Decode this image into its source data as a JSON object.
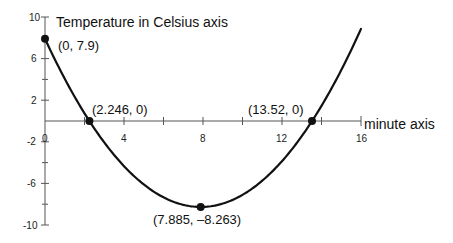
{
  "chart_data": {
    "type": "line",
    "title": "",
    "xlabel": "minute axis",
    "ylabel": "Temperature in Celsius axis",
    "xlim": [
      0,
      16
    ],
    "ylim": [
      -10,
      10
    ],
    "x_ticks": [
      0,
      4,
      8,
      12,
      16
    ],
    "y_ticks": [
      10,
      6,
      2,
      -2,
      -6,
      -10
    ],
    "x_tick_labels": [
      "0",
      "4",
      "8",
      "12",
      "16"
    ],
    "y_tick_labels": [
      "10",
      "6",
      "2",
      "-2",
      "-6",
      "-10"
    ],
    "grid": false,
    "legend": null,
    "series": [
      {
        "name": "temperature curve (parabola)",
        "x": [
          0,
          1,
          2,
          2.246,
          3,
          4,
          5,
          6,
          7,
          7.885,
          9,
          10,
          11,
          12,
          13,
          13.52,
          14,
          15,
          16
        ],
        "y": [
          7.9,
          4.33,
          1.3,
          0,
          -2.1,
          -4.47,
          -6.1,
          -7.34,
          -8.06,
          -8.263,
          -7.94,
          -7.1,
          -5.72,
          -3.85,
          -1.42,
          0,
          1.27,
          4.65,
          8.85
        ]
      }
    ],
    "annotations": [
      {
        "x": 0,
        "y": 7.9,
        "label": "(0, 7.9)"
      },
      {
        "x": 2.246,
        "y": 0,
        "label": "(2.246, 0)"
      },
      {
        "x": 13.52,
        "y": 0,
        "label": "(13.52, 0)"
      },
      {
        "x": 7.885,
        "y": -8.263,
        "label": "(7.885, –8.263)"
      }
    ]
  },
  "labels": {
    "y_axis_title": "Temperature in Celsius axis",
    "x_axis_title": "minute axis",
    "tick_x0": "0",
    "tick_x4": "4",
    "tick_x8": "8",
    "tick_x12": "12",
    "tick_x16": "16",
    "tick_y10": "10",
    "tick_y6": "6",
    "tick_y2": "2",
    "tick_yn2": "-2",
    "tick_yn6": "-6",
    "tick_yn10": "-10",
    "pt_start": "(0, 7.9)",
    "pt_root1": "(2.246, 0)",
    "pt_root2": "(13.52, 0)",
    "pt_min": "(7.885, –8.263)"
  }
}
